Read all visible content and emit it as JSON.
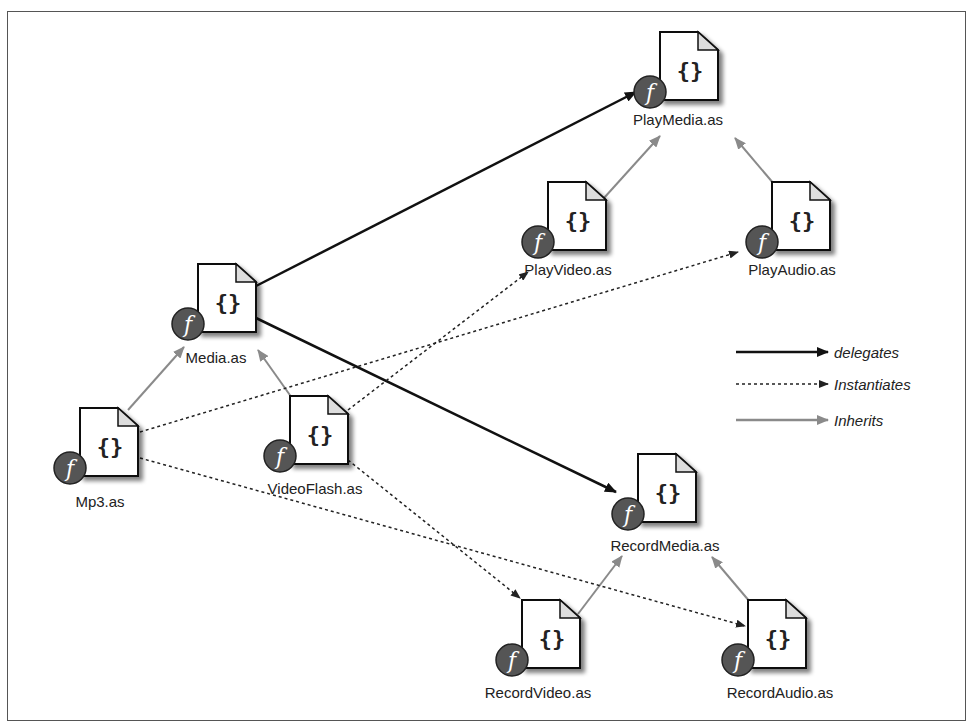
{
  "diagram": {
    "title": "",
    "nodes": [
      {
        "id": "playmedia",
        "label": "PlayMedia.as",
        "x": 660,
        "y": 32
      },
      {
        "id": "playvideo",
        "label": "PlayVideo.as",
        "x": 548,
        "y": 182
      },
      {
        "id": "playaudio",
        "label": "PlayAudio.as",
        "x": 772,
        "y": 182
      },
      {
        "id": "media",
        "label": "Media.as",
        "x": 198,
        "y": 264
      },
      {
        "id": "mp3",
        "label": "Mp3.as",
        "x": 80,
        "y": 408
      },
      {
        "id": "videoflash",
        "label": "VideoFlash.as",
        "x": 290,
        "y": 396
      },
      {
        "id": "recordmedia",
        "label": "RecordMedia.as",
        "x": 638,
        "y": 454
      },
      {
        "id": "recordvideo",
        "label": "RecordVideo.as",
        "x": 522,
        "y": 600
      },
      {
        "id": "recordaudio",
        "label": "RecordAudio.as",
        "x": 748,
        "y": 600
      }
    ],
    "edges": [
      {
        "from": "media",
        "to": "playmedia",
        "type": "delegates"
      },
      {
        "from": "media",
        "to": "recordmedia",
        "type": "delegates"
      },
      {
        "from": "playvideo",
        "to": "playmedia",
        "type": "inherits"
      },
      {
        "from": "playaudio",
        "to": "playmedia",
        "type": "inherits"
      },
      {
        "from": "mp3",
        "to": "media",
        "type": "inherits"
      },
      {
        "from": "videoflash",
        "to": "media",
        "type": "inherits"
      },
      {
        "from": "recordvideo",
        "to": "recordmedia",
        "type": "inherits"
      },
      {
        "from": "recordaudio",
        "to": "recordmedia",
        "type": "inherits"
      },
      {
        "from": "videoflash",
        "to": "playvideo",
        "type": "instantiates"
      },
      {
        "from": "videoflash",
        "to": "recordvideo",
        "type": "instantiates"
      },
      {
        "from": "mp3",
        "to": "playaudio",
        "type": "instantiates"
      },
      {
        "from": "mp3",
        "to": "recordaudio",
        "type": "instantiates"
      }
    ],
    "icon": {
      "name": "actionscript-file-icon",
      "glyph": "{}",
      "badge": "flash-icon",
      "badge_glyph": "f"
    },
    "colors": {
      "delegates": "#111111",
      "instantiates": "#222222",
      "inherits": "#8a8a8a",
      "badge": "#555555",
      "border": "#555555"
    }
  },
  "legend": {
    "items": [
      {
        "label": "delegates",
        "style": "solid-black"
      },
      {
        "label": "Instantiates",
        "style": "dotted"
      },
      {
        "label": "Inherits",
        "style": "solid-gray"
      }
    ]
  }
}
